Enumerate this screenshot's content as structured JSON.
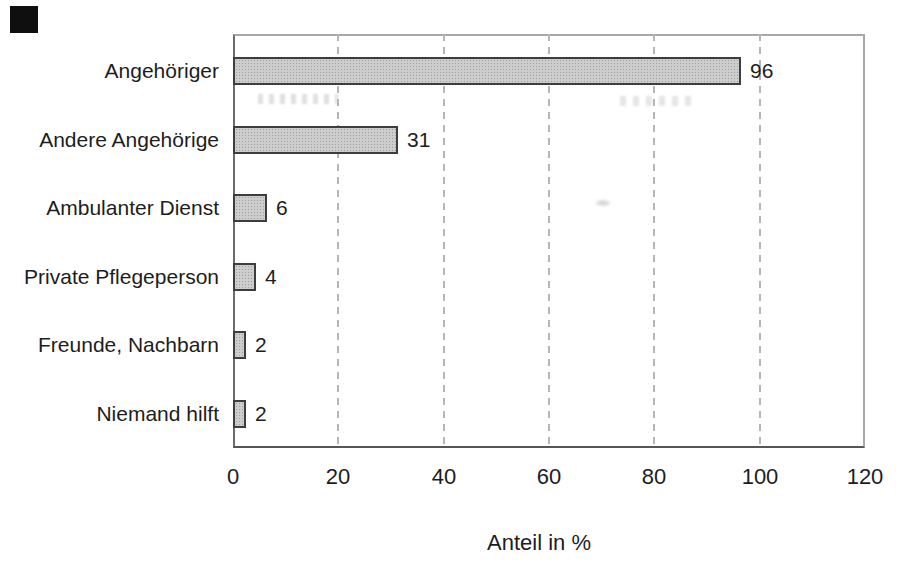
{
  "chart_data": {
    "type": "bar",
    "orientation": "horizontal",
    "title": "",
    "categories": [
      "Angehöriger",
      "Andere Angehörige",
      "Ambulanter Dienst",
      "Private Pflegeperson",
      "Freunde, Nachbarn",
      "Niemand hilft"
    ],
    "values": [
      96,
      31,
      6,
      4,
      2,
      2
    ],
    "value_labels": [
      "96",
      "31",
      "6",
      "4",
      "2",
      "2"
    ],
    "xlabel": "Anteil in %",
    "ylabel": "",
    "xlim": [
      0,
      120
    ],
    "x_ticks": [
      0,
      20,
      40,
      60,
      80,
      100,
      120
    ],
    "x_tick_labels": [
      "0",
      "20",
      "40",
      "60",
      "80",
      "100",
      "120"
    ],
    "grid": "vertical dashed lines at 20,40,60,80,100",
    "legend": "none",
    "colors": {
      "background": "#ffffff",
      "bar_fill": "#cdcdcd",
      "bar_stipple": "#9f9f9f",
      "bar_border": "#3d3d3d",
      "gridline": "#b6b6b6",
      "plot_border": "#a8a8a8",
      "axis": "#565656",
      "text": "#1d1d1d",
      "scan_artifact": "#0f0f0f"
    }
  }
}
